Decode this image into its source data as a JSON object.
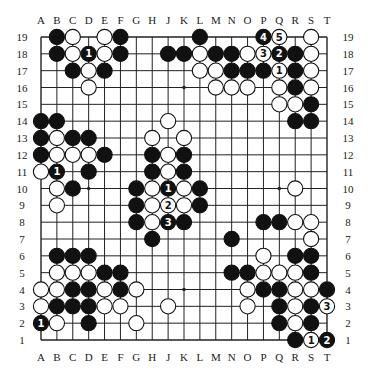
{
  "diagram": {
    "type": "go-board",
    "size": 19,
    "columns": [
      "A",
      "B",
      "C",
      "D",
      "E",
      "F",
      "G",
      "H",
      "J",
      "K",
      "L",
      "M",
      "N",
      "O",
      "P",
      "Q",
      "R",
      "S",
      "T"
    ],
    "rows": [
      19,
      18,
      17,
      16,
      15,
      14,
      13,
      12,
      11,
      10,
      9,
      8,
      7,
      6,
      5,
      4,
      3,
      2,
      1
    ],
    "colors": {
      "black": "#111111",
      "white": "#ffffff",
      "line": "#222222",
      "background": "#ffffff"
    },
    "star_points": [
      "D16",
      "K16",
      "Q16",
      "D10",
      "K10",
      "Q10",
      "D4",
      "K4",
      "Q4"
    ],
    "stones": [
      {
        "pos": "B19",
        "color": "black"
      },
      {
        "pos": "C19",
        "color": "white"
      },
      {
        "pos": "E19",
        "color": "white"
      },
      {
        "pos": "F19",
        "color": "black"
      },
      {
        "pos": "L19",
        "color": "black"
      },
      {
        "pos": "P19",
        "color": "black",
        "label": "4"
      },
      {
        "pos": "Q19",
        "color": "white",
        "label": "5"
      },
      {
        "pos": "S19",
        "color": "white"
      },
      {
        "pos": "B18",
        "color": "black"
      },
      {
        "pos": "C18",
        "color": "white"
      },
      {
        "pos": "D18",
        "color": "black",
        "label": "1"
      },
      {
        "pos": "E18",
        "color": "white"
      },
      {
        "pos": "F18",
        "color": "black"
      },
      {
        "pos": "J18",
        "color": "black"
      },
      {
        "pos": "K18",
        "color": "black"
      },
      {
        "pos": "L18",
        "color": "white"
      },
      {
        "pos": "M18",
        "color": "black"
      },
      {
        "pos": "N18",
        "color": "black"
      },
      {
        "pos": "O18",
        "color": "white"
      },
      {
        "pos": "P18",
        "color": "white",
        "label": "3"
      },
      {
        "pos": "Q18",
        "color": "black",
        "label": "2"
      },
      {
        "pos": "R18",
        "color": "black"
      },
      {
        "pos": "S18",
        "color": "white"
      },
      {
        "pos": "C17",
        "color": "black"
      },
      {
        "pos": "D17",
        "color": "white"
      },
      {
        "pos": "E17",
        "color": "black"
      },
      {
        "pos": "L17",
        "color": "white"
      },
      {
        "pos": "M17",
        "color": "white"
      },
      {
        "pos": "N17",
        "color": "black"
      },
      {
        "pos": "O17",
        "color": "black"
      },
      {
        "pos": "P17",
        "color": "black"
      },
      {
        "pos": "Q17",
        "color": "white",
        "label": "1"
      },
      {
        "pos": "R17",
        "color": "black"
      },
      {
        "pos": "S17",
        "color": "white"
      },
      {
        "pos": "D16",
        "color": "white"
      },
      {
        "pos": "M16",
        "color": "white"
      },
      {
        "pos": "N16",
        "color": "white"
      },
      {
        "pos": "O16",
        "color": "white"
      },
      {
        "pos": "Q16",
        "color": "white"
      },
      {
        "pos": "R16",
        "color": "black"
      },
      {
        "pos": "S16",
        "color": "white"
      },
      {
        "pos": "Q15",
        "color": "white"
      },
      {
        "pos": "R15",
        "color": "white"
      },
      {
        "pos": "S15",
        "color": "black"
      },
      {
        "pos": "A14",
        "color": "black"
      },
      {
        "pos": "B14",
        "color": "black"
      },
      {
        "pos": "J14",
        "color": "white"
      },
      {
        "pos": "R14",
        "color": "black"
      },
      {
        "pos": "S14",
        "color": "black"
      },
      {
        "pos": "A13",
        "color": "black"
      },
      {
        "pos": "B13",
        "color": "white"
      },
      {
        "pos": "C13",
        "color": "black"
      },
      {
        "pos": "D13",
        "color": "black"
      },
      {
        "pos": "H13",
        "color": "white"
      },
      {
        "pos": "K13",
        "color": "white"
      },
      {
        "pos": "A12",
        "color": "black"
      },
      {
        "pos": "B12",
        "color": "white"
      },
      {
        "pos": "C12",
        "color": "white"
      },
      {
        "pos": "D12",
        "color": "white"
      },
      {
        "pos": "E12",
        "color": "black"
      },
      {
        "pos": "H12",
        "color": "black"
      },
      {
        "pos": "J12",
        "color": "white"
      },
      {
        "pos": "K12",
        "color": "black"
      },
      {
        "pos": "A11",
        "color": "white"
      },
      {
        "pos": "B11",
        "color": "black",
        "label": "1"
      },
      {
        "pos": "D11",
        "color": "black"
      },
      {
        "pos": "H11",
        "color": "black"
      },
      {
        "pos": "J11",
        "color": "white"
      },
      {
        "pos": "K11",
        "color": "black"
      },
      {
        "pos": "B10",
        "color": "white"
      },
      {
        "pos": "C10",
        "color": "black"
      },
      {
        "pos": "G10",
        "color": "black"
      },
      {
        "pos": "H10",
        "color": "white"
      },
      {
        "pos": "J10",
        "color": "black",
        "label": "1"
      },
      {
        "pos": "K10",
        "color": "white"
      },
      {
        "pos": "L10",
        "color": "black"
      },
      {
        "pos": "R10",
        "color": "white"
      },
      {
        "pos": "B9",
        "color": "white"
      },
      {
        "pos": "G9",
        "color": "black"
      },
      {
        "pos": "H9",
        "color": "white"
      },
      {
        "pos": "J9",
        "color": "white",
        "label": "2"
      },
      {
        "pos": "K9",
        "color": "white"
      },
      {
        "pos": "L9",
        "color": "black"
      },
      {
        "pos": "G8",
        "color": "black"
      },
      {
        "pos": "H8",
        "color": "white"
      },
      {
        "pos": "J8",
        "color": "black",
        "label": "3"
      },
      {
        "pos": "K8",
        "color": "black"
      },
      {
        "pos": "P8",
        "color": "black"
      },
      {
        "pos": "Q8",
        "color": "black"
      },
      {
        "pos": "R8",
        "color": "white"
      },
      {
        "pos": "S8",
        "color": "white"
      },
      {
        "pos": "H7",
        "color": "black"
      },
      {
        "pos": "N7",
        "color": "black"
      },
      {
        "pos": "S7",
        "color": "white"
      },
      {
        "pos": "B6",
        "color": "black"
      },
      {
        "pos": "C6",
        "color": "black"
      },
      {
        "pos": "D6",
        "color": "black"
      },
      {
        "pos": "P6",
        "color": "white"
      },
      {
        "pos": "R6",
        "color": "black"
      },
      {
        "pos": "S6",
        "color": "black"
      },
      {
        "pos": "B5",
        "color": "white"
      },
      {
        "pos": "C5",
        "color": "white"
      },
      {
        "pos": "D5",
        "color": "white"
      },
      {
        "pos": "E5",
        "color": "black"
      },
      {
        "pos": "F5",
        "color": "black"
      },
      {
        "pos": "N5",
        "color": "black"
      },
      {
        "pos": "O5",
        "color": "black"
      },
      {
        "pos": "P5",
        "color": "white"
      },
      {
        "pos": "Q5",
        "color": "white"
      },
      {
        "pos": "R5",
        "color": "white"
      },
      {
        "pos": "S5",
        "color": "black"
      },
      {
        "pos": "A4",
        "color": "white"
      },
      {
        "pos": "B4",
        "color": "white"
      },
      {
        "pos": "C4",
        "color": "black"
      },
      {
        "pos": "D4",
        "color": "black"
      },
      {
        "pos": "E4",
        "color": "white"
      },
      {
        "pos": "F4",
        "color": "black"
      },
      {
        "pos": "G4",
        "color": "white"
      },
      {
        "pos": "O4",
        "color": "white"
      },
      {
        "pos": "P4",
        "color": "black"
      },
      {
        "pos": "Q4",
        "color": "black"
      },
      {
        "pos": "R4",
        "color": "white"
      },
      {
        "pos": "S4",
        "color": "white"
      },
      {
        "pos": "T4",
        "color": "black"
      },
      {
        "pos": "A3",
        "color": "white"
      },
      {
        "pos": "B3",
        "color": "black"
      },
      {
        "pos": "C3",
        "color": "black"
      },
      {
        "pos": "D3",
        "color": "black"
      },
      {
        "pos": "E3",
        "color": "white"
      },
      {
        "pos": "F3",
        "color": "white"
      },
      {
        "pos": "J3",
        "color": "white"
      },
      {
        "pos": "O3",
        "color": "white"
      },
      {
        "pos": "Q3",
        "color": "black"
      },
      {
        "pos": "R3",
        "color": "white"
      },
      {
        "pos": "S3",
        "color": "black"
      },
      {
        "pos": "T3",
        "color": "white",
        "label": "3"
      },
      {
        "pos": "A2",
        "color": "black",
        "label": "1"
      },
      {
        "pos": "B2",
        "color": "white"
      },
      {
        "pos": "D2",
        "color": "black"
      },
      {
        "pos": "G2",
        "color": "white"
      },
      {
        "pos": "Q2",
        "color": "black"
      },
      {
        "pos": "R2",
        "color": "white"
      },
      {
        "pos": "S2",
        "color": "black"
      },
      {
        "pos": "R1",
        "color": "black"
      },
      {
        "pos": "S1",
        "color": "white",
        "label": "1"
      },
      {
        "pos": "T1",
        "color": "black",
        "label": "2"
      }
    ]
  }
}
